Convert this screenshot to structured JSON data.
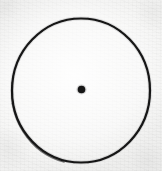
{
  "figure": {
    "kind": "geometric-diagram",
    "medium": "hand-drawn ink on textured paper (scanned)",
    "caption": "",
    "canvas": {
      "width": 162,
      "height": 171
    },
    "colors": {
      "paper": "#f4f4f3",
      "paper_shadow": "#e9e9e7",
      "ink": "#151515",
      "ink_soft": "#2e2e2e"
    },
    "shapes": [
      {
        "id": "outer-circle",
        "name": "circle-outline",
        "type": "ellipse",
        "cx": 81,
        "cy": 90.5,
        "rx": 69,
        "ry": 72,
        "stroke": "#141414",
        "stroke_width": 2.2,
        "fill": "none",
        "bounds": {
          "left": 12,
          "top": 18.5,
          "right": 150,
          "bottom": 162.5
        }
      },
      {
        "id": "center-dot",
        "name": "center-point",
        "type": "circle",
        "cx": 81.5,
        "cy": 89.5,
        "r": 3.8,
        "stroke": "none",
        "fill": "#141414"
      }
    ],
    "labels": []
  }
}
